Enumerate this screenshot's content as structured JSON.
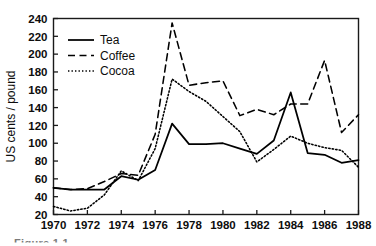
{
  "figure": {
    "caption": "Figure 1.1",
    "ylabel": "US cents / pound"
  },
  "legend": {
    "position": "top-left-inside",
    "entries": [
      {
        "label": "Tea",
        "style": "solid",
        "color": "#000000"
      },
      {
        "label": "Coffee",
        "style": "dashed",
        "color": "#000000"
      },
      {
        "label": "Cocoa",
        "style": "dotted",
        "color": "#000000"
      }
    ]
  },
  "axes": {
    "y_ticks": [
      20,
      40,
      60,
      80,
      100,
      120,
      140,
      160,
      180,
      200,
      220,
      240
    ],
    "x_ticks": [
      1970,
      1972,
      1974,
      1976,
      1978,
      1980,
      1982,
      1984,
      1986,
      1988
    ]
  },
  "chart_data": {
    "type": "line",
    "title": "",
    "subtitle": "",
    "xlabel": "",
    "ylabel": "US cents / pound",
    "xlim": [
      1970,
      1988
    ],
    "ylim": [
      20,
      240
    ],
    "grid": false,
    "legend_position": "upper left",
    "x": [
      1970,
      1971,
      1972,
      1973,
      1974,
      1975,
      1976,
      1977,
      1978,
      1979,
      1980,
      1981,
      1982,
      1983,
      1984,
      1985,
      1986,
      1987,
      1988
    ],
    "series": [
      {
        "name": "Tea",
        "style": "solid",
        "color": "#000000",
        "values": [
          50,
          48,
          48,
          48,
          63,
          59,
          70,
          122,
          99,
          99,
          100,
          94,
          88,
          103,
          157,
          89,
          87,
          78,
          81
        ]
      },
      {
        "name": "Coffee",
        "style": "dashed",
        "color": "#000000",
        "values": [
          50,
          48,
          49,
          57,
          66,
          64,
          110,
          235,
          165,
          168,
          170,
          131,
          138,
          132,
          144,
          144,
          193,
          112,
          132
        ]
      },
      {
        "name": "Cocoa",
        "style": "dotted",
        "color": "#000000",
        "values": [
          29,
          24,
          27,
          42,
          69,
          58,
          94,
          172,
          158,
          147,
          130,
          113,
          79,
          93,
          108,
          100,
          95,
          92,
          73
        ]
      }
    ]
  }
}
